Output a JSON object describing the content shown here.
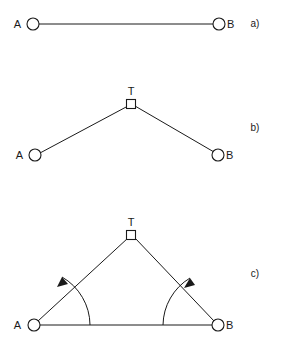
{
  "figure": {
    "background_color": "#ffffff",
    "ink_color": "#1a1a1a",
    "width": 283,
    "height": 343
  },
  "panels": [
    {
      "id": "a",
      "label": "a)",
      "label_x": 255,
      "label_y": 27,
      "nodes": [
        {
          "name": "A",
          "symbol": "circle",
          "x": 33,
          "y": 24,
          "label": "A",
          "label_x": 21,
          "label_y": 28
        },
        {
          "name": "B",
          "symbol": "circle",
          "x": 219,
          "y": 24,
          "label": "B",
          "label_x": 227,
          "label_y": 28
        }
      ],
      "edges": [
        {
          "from": "A",
          "to": "B",
          "x1": 39,
          "y1": 24,
          "x2": 213,
          "y2": 24
        }
      ],
      "angles": []
    },
    {
      "id": "b",
      "label": "b)",
      "label_x": 255,
      "label_y": 131,
      "nodes": [
        {
          "name": "A",
          "symbol": "circle",
          "x": 35,
          "y": 155,
          "label": "A",
          "label_x": 23,
          "label_y": 159
        },
        {
          "name": "B",
          "symbol": "circle",
          "x": 218,
          "y": 155,
          "label": "B",
          "label_x": 226,
          "label_y": 159
        },
        {
          "name": "T",
          "symbol": "square",
          "x": 131,
          "y": 104,
          "label": "T",
          "label_x": 128,
          "label_y": 94
        }
      ],
      "edges": [
        {
          "from": "A",
          "to": "T",
          "x1": 40,
          "y1": 153,
          "x2": 128,
          "y2": 106
        },
        {
          "from": "T",
          "to": "B",
          "x1": 135,
          "y1": 106,
          "x2": 214,
          "y2": 152
        }
      ],
      "angles": []
    },
    {
      "id": "c",
      "label": "c)",
      "label_x": 255,
      "label_y": 277,
      "nodes": [
        {
          "name": "A",
          "symbol": "circle",
          "x": 34,
          "y": 325,
          "label": "A",
          "label_x": 21,
          "label_y": 329
        },
        {
          "name": "B",
          "symbol": "circle",
          "x": 218,
          "y": 325,
          "label": "B",
          "label_x": 226,
          "label_y": 329
        },
        {
          "name": "T",
          "symbol": "square",
          "x": 131,
          "y": 235,
          "label": "T",
          "label_x": 128,
          "label_y": 225
        }
      ],
      "edges": [
        {
          "from": "A",
          "to": "T",
          "x1": 38,
          "y1": 321,
          "x2": 128,
          "y2": 238
        },
        {
          "from": "T",
          "to": "B",
          "x1": 135,
          "y1": 238,
          "x2": 214,
          "y2": 321
        },
        {
          "from": "A",
          "to": "B",
          "x1": 40,
          "y1": 325,
          "x2": 212,
          "y2": 325
        }
      ],
      "angles": [
        {
          "at": "A",
          "arc_path": "M 90 325 A 56 56 0 0 0 62 277",
          "arrow_points": "62,277 57,286 68,285"
        },
        {
          "at": "B",
          "arc_path": "M 163 325 A 56 56 0 0 1 190 278",
          "arrow_points": "190,278 185,287 196,286"
        }
      ]
    }
  ],
  "node_style": {
    "circle_radius": 6,
    "square_size": 9
  }
}
